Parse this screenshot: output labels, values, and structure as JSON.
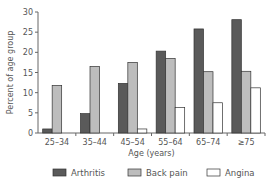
{
  "chart_data": {
    "type": "bar",
    "title": "",
    "xlabel": "Age (years)",
    "ylabel": "Percent of age group",
    "ylim": [
      0,
      30
    ],
    "yticks": [
      0,
      5,
      10,
      15,
      20,
      25,
      30
    ],
    "grid": false,
    "legend_position": "bottom",
    "categories": [
      "25–34",
      "35–44",
      "45–54",
      "55–64",
      "65–74",
      "≥75"
    ],
    "series": [
      {
        "name": "Arthritis",
        "color": "#5a5a5a",
        "values": [
          1.0,
          4.8,
          12.3,
          20.3,
          25.8,
          28.1
        ]
      },
      {
        "name": "Back pain",
        "color": "#bdbdbd",
        "values": [
          11.8,
          16.5,
          17.5,
          18.5,
          15.2,
          15.3
        ]
      },
      {
        "name": "Angina",
        "color": "#ffffff",
        "values": [
          0,
          0,
          1.0,
          6.3,
          7.5,
          11.2
        ]
      }
    ]
  }
}
